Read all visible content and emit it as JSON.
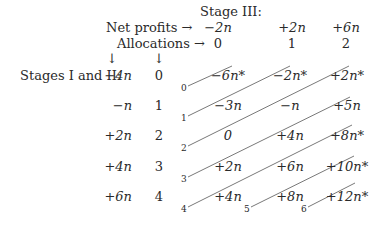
{
  "header": {
    "stage_title": "Stage III:",
    "net_profits_label": "Net profits →",
    "allocations_label": "Allocations →",
    "net_profits": [
      "−2n",
      "+2n",
      "+6n"
    ],
    "allocations": [
      "0",
      "1",
      "2"
    ]
  },
  "left": {
    "stages_label": "Stages I and II:",
    "down_arrow": "↓",
    "rows": [
      {
        "profit": "−4n",
        "alloc": "0"
      },
      {
        "profit": "−n",
        "alloc": "1"
      },
      {
        "profit": "+2n",
        "alloc": "2"
      },
      {
        "profit": "+4n",
        "alloc": "3"
      },
      {
        "profit": "+6n",
        "alloc": "4"
      }
    ]
  },
  "grid": [
    [
      "−6n*",
      "−2n*",
      "+2n*"
    ],
    [
      "−3n",
      "−n",
      "+5n"
    ],
    [
      "0",
      "+4n",
      "+8n*"
    ],
    [
      "+2n",
      "+6n",
      "+10n*"
    ],
    [
      "+4n",
      "+8n",
      "+12n*"
    ]
  ],
  "diagonal_labels": [
    "0",
    "1",
    "2",
    "3",
    "4",
    "5",
    "6"
  ]
}
